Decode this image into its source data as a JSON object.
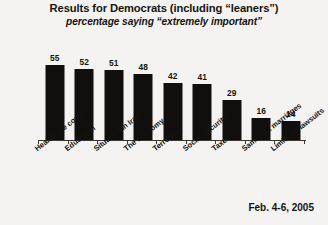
{
  "chart_data": {
    "type": "bar",
    "title": "Results for Democrats (including “leaners”)",
    "subtitle": "percentage saying “extremely important”",
    "xlabel": "",
    "ylabel": "",
    "ylim": [
      0,
      60
    ],
    "grid": false,
    "legend": "none",
    "annotation": "Feb. 4-6, 2005",
    "bar_color": "#100f0d",
    "background_color": "#f4f3f1",
    "categories": [
      "Healthcare costs",
      "Education",
      "Situation in Iraq",
      "The economy",
      "Terrorism",
      "Social Security",
      "Taxes",
      "Same-sex marriages",
      "Limits on lawsuits"
    ],
    "values": [
      55,
      52,
      51,
      48,
      42,
      41,
      29,
      16,
      14
    ]
  }
}
